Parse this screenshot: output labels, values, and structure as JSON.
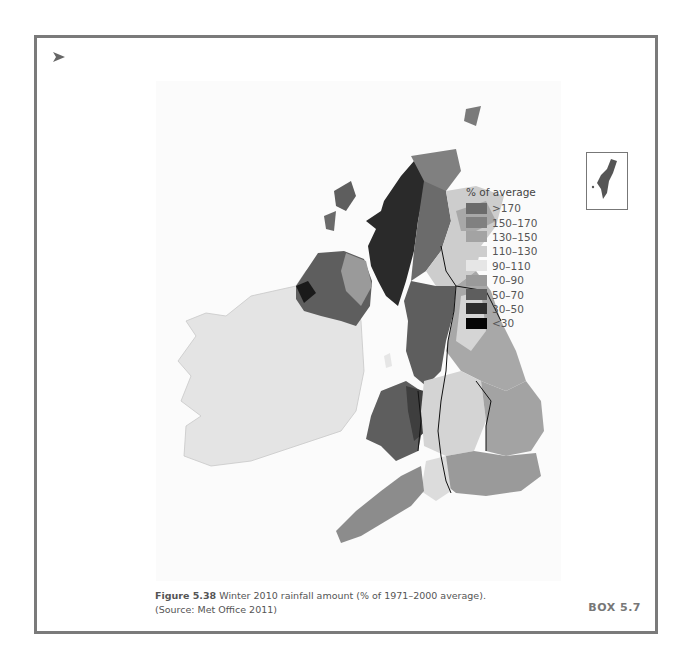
{
  "figure": {
    "marker_icon": "arrowhead-icon",
    "figure_number": "Figure 5.38",
    "caption_text": " Winter 2010 rainfall amount (% of 1971–2000 average).",
    "source_line": "(Source: Met Office 2011)",
    "box_label": "BOX 5.7"
  },
  "legend": {
    "title": "% of average",
    "items": [
      {
        "label": ">170",
        "color": "#6b6b6b"
      },
      {
        "label": "150–170",
        "color": "#808080"
      },
      {
        "label": "130–150",
        "color": "#a3a3a3"
      },
      {
        "label": "110–130",
        "color": "#cdcdcd"
      },
      {
        "label": "90–110",
        "color": "#e6e6e6"
      },
      {
        "label": "70–90",
        "color": "#9a9a9a"
      },
      {
        "label": "50–70",
        "color": "#5e5e5e"
      },
      {
        "label": "30–50",
        "color": "#2e2e2e"
      },
      {
        "label": "<30",
        "color": "#050505"
      }
    ]
  },
  "map": {
    "inset_label": "Shetland inset",
    "regions": {
      "ireland": "90–110",
      "northern_ireland": "50–70",
      "west_scotland": "30–50",
      "east_scotland": "110–130",
      "wales": "50–70",
      "north_west_england": "50–70",
      "east_england": "110–130",
      "south_east_england": "70–90",
      "south_west_england": "70–90"
    }
  }
}
